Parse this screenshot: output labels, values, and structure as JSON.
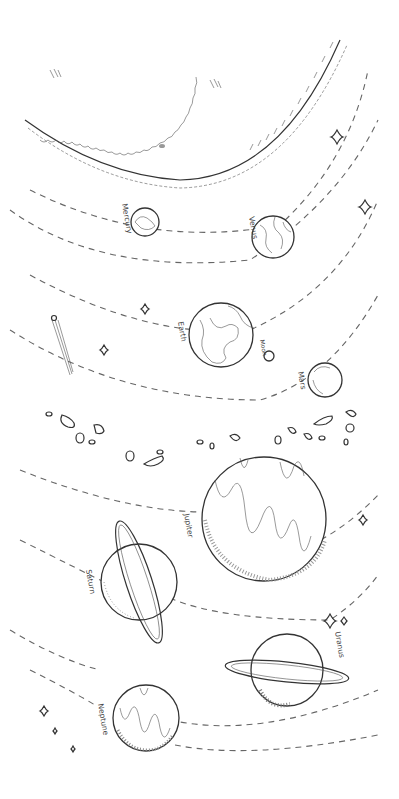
{
  "illustration": {
    "title": "Solar System line drawing",
    "colors": {
      "ink": "#333333",
      "orbit": "#666666",
      "background": "#ffffff"
    },
    "sun": {
      "label": ""
    },
    "planets": [
      {
        "name": "Mercury",
        "label": "Mercury"
      },
      {
        "name": "Venus",
        "label": "Venus"
      },
      {
        "name": "Earth",
        "label": "Earth"
      },
      {
        "name": "Moon",
        "label": "Moon"
      },
      {
        "name": "Mars",
        "label": "Mars"
      },
      {
        "name": "Jupiter",
        "label": "Jupiter"
      },
      {
        "name": "Saturn",
        "label": "Saturn"
      },
      {
        "name": "Uranus",
        "label": "Uranus"
      },
      {
        "name": "Neptune",
        "label": "Neptune"
      }
    ],
    "decorations": [
      "comet",
      "asteroid-belt",
      "sparkle-stars"
    ]
  }
}
